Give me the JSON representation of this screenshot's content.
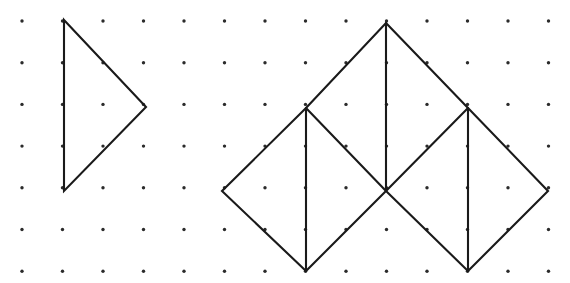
{
  "figure": {
    "canvas": {
      "width": 570,
      "height": 283,
      "background": "#ffffff"
    },
    "grid": {
      "type": "dot-lattice",
      "dot_color": "#2b2b2b",
      "dot_radius": 1.7,
      "origin_x": 22,
      "origin_y": 21,
      "spacing_x": 40.5,
      "spacing_y": 41.7,
      "cols": 14,
      "rows": 7
    },
    "stroke": {
      "color": "#1a1a1a",
      "width": 2.1
    },
    "shapes": [
      {
        "name": "left-triangle",
        "label": "Right triangle pointing right",
        "vertices": [
          [
            64,
            20
          ],
          [
            146,
            107
          ],
          [
            64,
            191
          ]
        ],
        "closed": true,
        "segments": []
      },
      {
        "name": "right-composite-net",
        "label": "Folded net of four triangles forming two squares",
        "vertices": [
          [
            386,
            23
          ],
          [
            468,
            108
          ],
          [
            548,
            191
          ],
          [
            468,
            271
          ],
          [
            386,
            191
          ],
          [
            306,
            271
          ],
          [
            222,
            191
          ],
          [
            306,
            108
          ]
        ],
        "closed": true,
        "segments": [
          {
            "name": "apex-to-center-vertical",
            "from": [
              386,
              23
            ],
            "to": [
              386,
              191
            ]
          },
          {
            "name": "left-inner-vertical",
            "from": [
              306,
              108
            ],
            "to": [
              306,
              271
            ]
          },
          {
            "name": "right-inner-vertical",
            "from": [
              468,
              108
            ],
            "to": [
              468,
              271
            ]
          },
          {
            "name": "left-diagonal-down",
            "from": [
              306,
              108
            ],
            "to": [
              386,
              191
            ]
          },
          {
            "name": "right-diagonal-down",
            "from": [
              468,
              108
            ],
            "to": [
              386,
              191
            ]
          }
        ]
      }
    ]
  }
}
